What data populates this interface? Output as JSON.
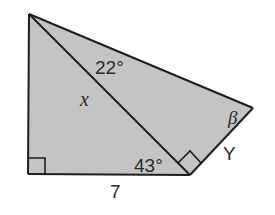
{
  "diagram": {
    "type": "geometry",
    "fill_color": "#c4c4c4",
    "stroke_color": "#1e1e1e",
    "labels": {
      "angle_top": "22°",
      "angle_bottom": "43°",
      "side_hypotenuse": "x",
      "side_base": "7",
      "side_right": "Y",
      "angle_right_vertex": "β"
    },
    "vertices": {
      "top_left": [
        29,
        14
      ],
      "bottom_left": [
        28,
        174
      ],
      "bottom_right": [
        190,
        175
      ],
      "right": [
        253,
        108
      ]
    }
  }
}
